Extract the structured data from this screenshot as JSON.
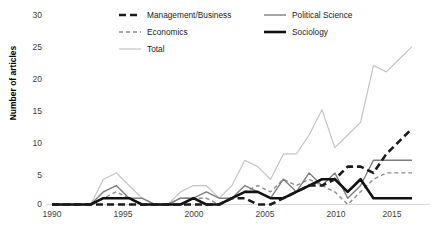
{
  "chart_data": {
    "type": "line",
    "title": "",
    "xlabel": "",
    "ylabel": "Number of articles",
    "xlim": [
      1990,
      2018
    ],
    "ylim": [
      0,
      30
    ],
    "y_ticks": [
      0,
      5,
      10,
      15,
      20,
      25,
      30
    ],
    "x_ticks": [
      1990,
      1995,
      2000,
      2005,
      2010,
      2015
    ],
    "grid": false,
    "legend_position": "top-center",
    "x": [
      1990,
      1991,
      1992,
      1993,
      1994,
      1995,
      1996,
      1997,
      1998,
      1999,
      2000,
      2001,
      2002,
      2003,
      2004,
      2005,
      2006,
      2007,
      2008,
      2009,
      2010,
      2011,
      2012,
      2013,
      2014,
      2015,
      2016,
      2017,
      2018
    ],
    "series": [
      {
        "name": "Management/Business",
        "color": "#1a1a1a",
        "style": "dashed-thick",
        "values": [
          0,
          0,
          0,
          0,
          0,
          0,
          0,
          0,
          0,
          0,
          0,
          0,
          0,
          0,
          1,
          1,
          0,
          0,
          1,
          2,
          3,
          3,
          4,
          6,
          6,
          5,
          8,
          10,
          12
        ]
      },
      {
        "name": "Political Science",
        "color": "#7f7f7f",
        "style": "solid-medium",
        "values": [
          0,
          0,
          0,
          0,
          2,
          3,
          1,
          1,
          0,
          0,
          1,
          1,
          2,
          1,
          1,
          3,
          2,
          1,
          4,
          2,
          5,
          3,
          5,
          1,
          3,
          7,
          7,
          7,
          7
        ]
      },
      {
        "name": "Economics",
        "color": "#8c8c8c",
        "style": "dashed-thin",
        "values": [
          0,
          0,
          0,
          0,
          1,
          2,
          1,
          0,
          0,
          0,
          1,
          1,
          1,
          0,
          1,
          2,
          3,
          2,
          4,
          3,
          4,
          3,
          2,
          0,
          2,
          4,
          5,
          5,
          5
        ]
      },
      {
        "name": "Sociology",
        "color": "#111111",
        "style": "solid-thick",
        "values": [
          0,
          0,
          0,
          0,
          1,
          1,
          1,
          0,
          0,
          0,
          0,
          1,
          0,
          0,
          1,
          2,
          2,
          1,
          1,
          2,
          3,
          4,
          4,
          2,
          4,
          1,
          1,
          1,
          1
        ]
      },
      {
        "name": "Total",
        "color": "#c4c4c4",
        "style": "solid-thin",
        "values": [
          0,
          0,
          0,
          0,
          4,
          5,
          3,
          1,
          0,
          0,
          2,
          3,
          3,
          1,
          3,
          7,
          6,
          4,
          8,
          8,
          11,
          15,
          9,
          11,
          13,
          22,
          21,
          23,
          25
        ]
      }
    ]
  },
  "axes": {
    "y_axis_title": "Number of articles",
    "y_tick_labels": [
      "0",
      "5",
      "10",
      "15",
      "20",
      "25",
      "30"
    ],
    "x_tick_labels": [
      "1990",
      "1995",
      "2000",
      "2005",
      "2010",
      "2015"
    ]
  },
  "legend": {
    "entries": [
      {
        "label": "Management/Business",
        "swatch": "dashed-thick-black"
      },
      {
        "label": "Political Science",
        "swatch": "solid-medium-gray"
      },
      {
        "label": "Economics",
        "swatch": "dashed-thin-gray"
      },
      {
        "label": "Sociology",
        "swatch": "solid-thick-black"
      },
      {
        "label": "Total",
        "swatch": "solid-thin-lightgray"
      }
    ]
  },
  "colors": {
    "management": "#1a1a1a",
    "political_science": "#7f7f7f",
    "economics": "#8c8c8c",
    "sociology": "#111111",
    "total": "#c4c4c4",
    "axis": "#d0d0d0",
    "tick_text": "#404040"
  }
}
